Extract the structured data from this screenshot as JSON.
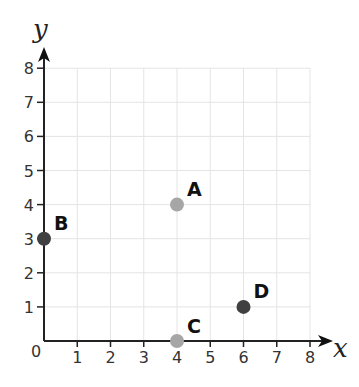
{
  "chart_data": {
    "type": "scatter",
    "title": "",
    "xlabel": "x",
    "ylabel": "y",
    "xlim": [
      0,
      8
    ],
    "ylim": [
      0,
      8
    ],
    "x_ticks": [
      "0",
      "1",
      "2",
      "3",
      "4",
      "5",
      "6",
      "7",
      "8"
    ],
    "y_ticks": [
      "1",
      "2",
      "3",
      "4",
      "5",
      "6",
      "7",
      "8"
    ],
    "grid": true,
    "points": [
      {
        "label": "A",
        "x": 4,
        "y": 4,
        "color": "#a6a6a6"
      },
      {
        "label": "B",
        "x": 0,
        "y": 3,
        "color": "#404040"
      },
      {
        "label": "C",
        "x": 4,
        "y": 0,
        "color": "#a6a6a6"
      },
      {
        "label": "D",
        "x": 6,
        "y": 1,
        "color": "#404040"
      }
    ]
  },
  "colors": {
    "grid": "#e4e4e4",
    "axis": "#222222"
  }
}
